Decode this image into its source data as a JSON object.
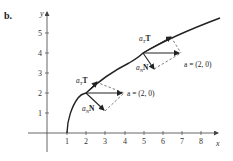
{
  "panel_label": "b.",
  "axes": {
    "x_label": "x",
    "y_label": "y",
    "x_ticks": [
      "1",
      "2",
      "3",
      "4",
      "5",
      "6",
      "7",
      "8"
    ],
    "y_ticks": [
      "1",
      "2",
      "3",
      "4",
      "5"
    ]
  },
  "curve": {
    "description": "parabola x = 1 + y^2/4, starting at (1,0)"
  },
  "points": [
    {
      "at": [
        2,
        2
      ],
      "tangent_label": "a",
      "tangent_sub": "T",
      "tangent_vec": "T",
      "normal_label": "a",
      "normal_sub": "N",
      "normal_vec": "N",
      "accel_label": "a = (2, 0)"
    },
    {
      "at": [
        5,
        4
      ],
      "tangent_label": "a",
      "tangent_sub": "T",
      "tangent_vec": "T",
      "normal_label": "a",
      "normal_sub": "N",
      "normal_vec": "N",
      "accel_label": "a = (2, 0)"
    }
  ],
  "colors": {
    "ink": "#222222",
    "axis": "#555555"
  }
}
